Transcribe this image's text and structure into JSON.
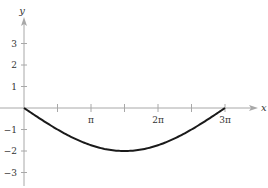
{
  "chart_data": {
    "type": "line",
    "title": "",
    "xlabel": "x",
    "ylabel": "y",
    "function": "y = -2 sin(x/3)",
    "xlim": [
      0,
      9.4248
    ],
    "ylim": [
      -3.5,
      3.7
    ],
    "grid": false,
    "legend": null,
    "x_ticks": [
      {
        "value": 1.5708,
        "label": ""
      },
      {
        "value": 3.1416,
        "label": "π"
      },
      {
        "value": 4.7124,
        "label": ""
      },
      {
        "value": 6.2832,
        "label": "2π"
      },
      {
        "value": 7.854,
        "label": ""
      },
      {
        "value": 9.4248,
        "label": "3π"
      }
    ],
    "y_ticks": [
      {
        "value": 3,
        "label": "3"
      },
      {
        "value": 2,
        "label": "2"
      },
      {
        "value": 1,
        "label": "1"
      },
      {
        "value": -1,
        "label": "−1"
      },
      {
        "value": -2,
        "label": "−2"
      },
      {
        "value": -3,
        "label": "−3"
      }
    ],
    "series": [
      {
        "name": "y = -2 sin(x/3)",
        "x": [
          0,
          0.7854,
          1.5708,
          2.3562,
          3.1416,
          3.927,
          4.7124,
          5.4978,
          6.2832,
          7.0686,
          7.854,
          8.6394,
          9.4248
        ],
        "y": [
          0,
          -0.5176,
          -1.0,
          -1.4142,
          -1.7321,
          -1.9319,
          -2.0,
          -1.9319,
          -1.7321,
          -1.4142,
          -1.0,
          -0.5176,
          0
        ]
      }
    ],
    "key_points": [
      {
        "x": 0,
        "y": 0,
        "note": "start"
      },
      {
        "x": 4.7124,
        "y": -2,
        "note": "minimum at 3π/2"
      },
      {
        "x": 9.4248,
        "y": 0,
        "note": "end at 3π"
      }
    ]
  },
  "colors": {
    "axis": "#a8a8a8",
    "curve": "#1a1a1a",
    "text": "#333333"
  },
  "axes": {
    "x_label": "x",
    "y_label": "y"
  }
}
